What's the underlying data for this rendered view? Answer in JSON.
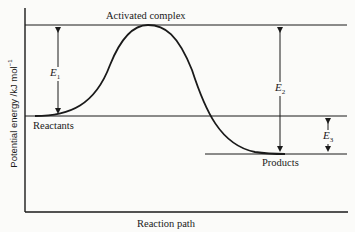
{
  "diagram": {
    "labels": {
      "activated_complex": "Activated complex",
      "reactants": "Reactants",
      "products": "Products",
      "x_axis": "Reaction path",
      "y_axis_main": "Potential energy /kJ mol",
      "y_axis_exp": "−1"
    },
    "energies": [
      {
        "symbol": "E",
        "subscript": "1",
        "meaning": "Activation energy (reactants to activated complex)"
      },
      {
        "symbol": "E",
        "subscript": "2",
        "meaning": "Activated complex to products"
      },
      {
        "symbol": "E",
        "subscript": "3",
        "meaning": "Reactants to products (enthalpy change)"
      }
    ],
    "colors": {
      "line": "#1a1a1a",
      "background": "#fbfbf9"
    }
  }
}
